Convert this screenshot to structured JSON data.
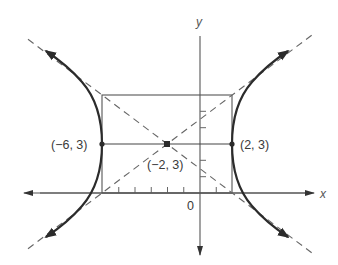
{
  "diagram": {
    "type": "hyperbola",
    "equation_implied": "(x+2)^2/16 - (y-3)^2/9 = 1",
    "axes": {
      "x_label": "x",
      "y_label": "y",
      "origin_label": "0"
    },
    "points": [
      {
        "id": "left-vertex",
        "label": "(−6, 3)",
        "x": -6,
        "y": 3
      },
      {
        "id": "center",
        "label": "(−2, 3)",
        "x": -2,
        "y": 3
      },
      {
        "id": "right-vertex",
        "label": "(2, 3)",
        "x": 2,
        "y": 3
      }
    ],
    "rectangle": {
      "x_min": -6,
      "x_max": 2,
      "y_min": 0,
      "y_max": 6
    },
    "asymptotes": [
      {
        "slope": 0.75,
        "through": [
          -2,
          3
        ]
      },
      {
        "slope": -0.75,
        "through": [
          -2,
          3
        ]
      }
    ],
    "colors": {
      "curve": "#2b2b2b",
      "lines": "#555555",
      "dashes": "#666666"
    }
  }
}
